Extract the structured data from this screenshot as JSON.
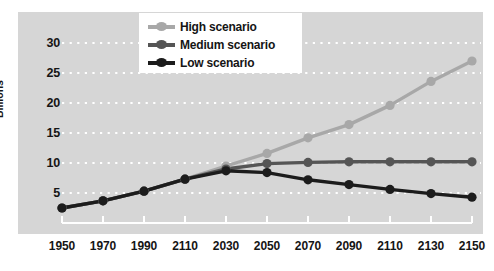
{
  "chart_data": {
    "type": "line",
    "title": "",
    "xlabel": "",
    "ylabel": "Billions",
    "x": [
      "1950",
      "1970",
      "1990",
      "2110",
      "2030",
      "2050",
      "2070",
      "2090",
      "2110",
      "2130",
      "2150"
    ],
    "xtick_labels": [
      "1950",
      "1970",
      "1990",
      "2110",
      "2030",
      "2050",
      "2070",
      "2090",
      "2110",
      "2130",
      "2150"
    ],
    "ytick_labels": [
      "5",
      "10",
      "15",
      "20",
      "25",
      "30"
    ],
    "ytick_values": [
      5,
      10,
      15,
      20,
      25,
      30
    ],
    "ylim": [
      0,
      32
    ],
    "grid": "horizontal dotted white",
    "legend_position": "top-center",
    "series": [
      {
        "name": "High scenario",
        "color": "#a8a8a8",
        "values": [
          2.5,
          3.7,
          5.3,
          7.3,
          9.5,
          11.6,
          14.2,
          16.4,
          19.6,
          23.6,
          27.0
        ]
      },
      {
        "name": "Medium scenario",
        "color": "#555555",
        "values": [
          2.5,
          3.7,
          5.3,
          7.3,
          9.0,
          9.9,
          10.1,
          10.2,
          10.2,
          10.2,
          10.2
        ]
      },
      {
        "name": "Low scenario",
        "color": "#1c1c1c",
        "values": [
          2.5,
          3.7,
          5.3,
          7.3,
          8.7,
          8.4,
          7.2,
          6.4,
          5.6,
          4.9,
          4.3
        ]
      }
    ]
  },
  "legend": {
    "items": [
      {
        "label": "High scenario",
        "color": "#a8a8a8"
      },
      {
        "label": "Medium scenario",
        "color": "#555555"
      },
      {
        "label": "Low scenario",
        "color": "#1c1c1c"
      }
    ]
  },
  "axes": {
    "y_title": "Billions"
  },
  "colors": {
    "panel_background": "#d6d6d6",
    "page_background": "#ffffff",
    "gridline": "#ffffff",
    "axis": "#ffffff",
    "text": "#151515"
  }
}
